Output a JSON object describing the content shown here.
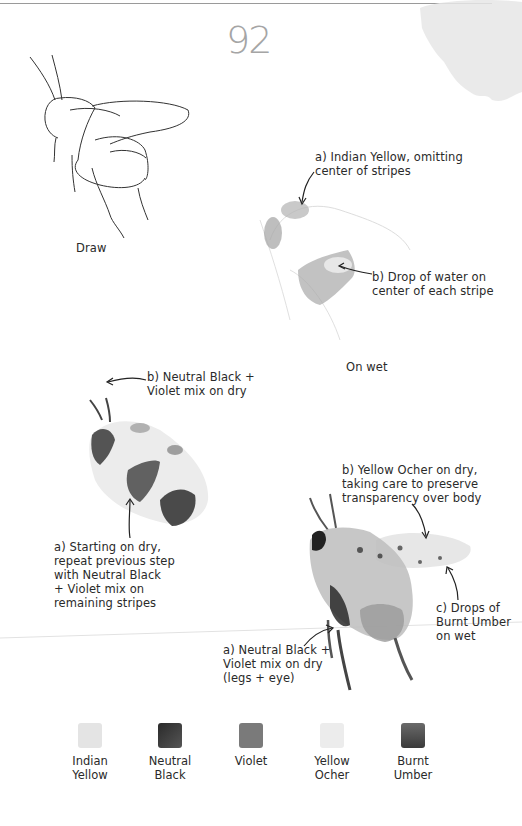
{
  "page": {
    "number": "92"
  },
  "steps": {
    "draw": {
      "label": "Draw"
    },
    "on_wet": {
      "label": "On wet",
      "note_a": "a) Indian Yellow, omitting\ncenter of stripes",
      "note_b": "b) Drop of water on\ncenter of each stripe"
    },
    "on_dry_stripes": {
      "note_b": "b) Neutral Black +\nViolet mix on dry",
      "note_a": "a) Starting on dry,\nrepeat previous step\nwith Neutral Black\n+ Violet mix on\nremaining stripes"
    },
    "final": {
      "note_b": "b) Yellow Ocher on dry,\ntaking care to preserve\ntransparency over body",
      "note_c": "c) Drops of\nBurnt Umber\non wet",
      "note_a": "a) Neutral Black +\nViolet mix on dry\n(legs + eye)"
    }
  },
  "palette": [
    {
      "name": "Indian\nYellow",
      "color": "#e4e4e4"
    },
    {
      "name": "Neutral\nBlack",
      "color": "#3a3a3a"
    },
    {
      "name": "Violet",
      "color": "#7a7a7a"
    },
    {
      "name": "Yellow\nOcher",
      "color": "#ececec"
    },
    {
      "name": "Burnt\nUmber",
      "color": "#5e5e5e"
    }
  ]
}
